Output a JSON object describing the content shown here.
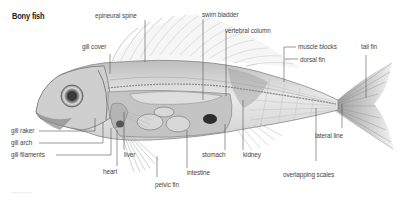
{
  "title": "Bony fish",
  "labels": {
    "epineural_spine": "epineural spine",
    "gill_cover": "gill cover",
    "swim_bladder": "swim bladder",
    "vertebral_column": "vertebral column",
    "muscle_blocks": "muscle blocks",
    "dorsal_fin": "dorsal fin",
    "tail_fin": "tail fin",
    "gill_raker": "gill raker",
    "gill_arch": "gill arch",
    "gill_filaments": "gill filaments",
    "liver": "liver",
    "heart": "heart",
    "pelvic_fin": "pelvic fin",
    "intestine": "intestine",
    "stomach": "stomach",
    "kidney": "kidney",
    "lateral_line": "lateral line",
    "overlapping_scales": "overlapping scales"
  },
  "footer": "·······",
  "colors": {
    "line": "#555555",
    "fish_dark": "#6e6e6e",
    "fish_light": "#e4e4e4"
  }
}
